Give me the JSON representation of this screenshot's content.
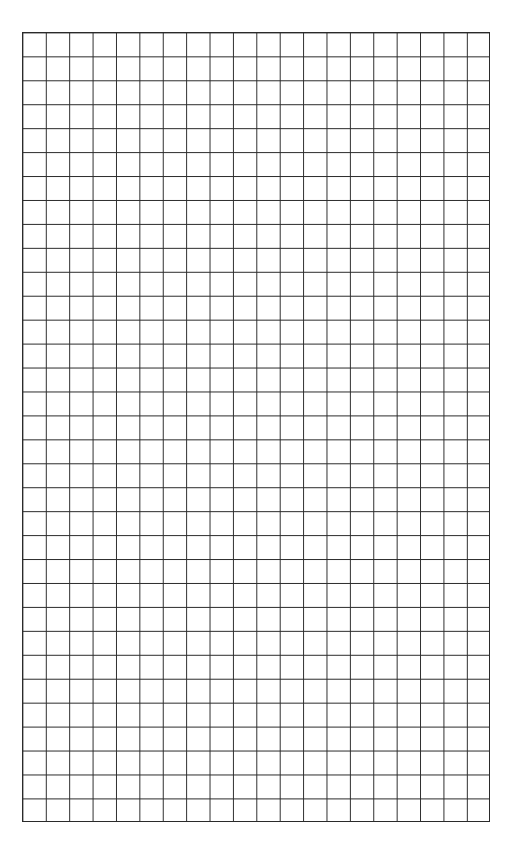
{
  "page": {
    "type": "graph-paper",
    "background_color": "#ffffff",
    "line_color": "#2a2a2a"
  },
  "grid": {
    "columns": 20,
    "rows": 33,
    "cell_width_px": 23.4,
    "cell_height_px": 23.9
  },
  "footer": {
    "text": ""
  }
}
